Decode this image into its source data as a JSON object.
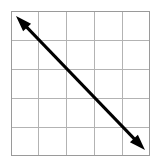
{
  "figure": {
    "title": "Diagonal double-headed arrow on a 5 by 5 grid",
    "background_color": "#ffffff",
    "width": 160,
    "height": 166
  },
  "grid": {
    "name": "graph-paper-grid",
    "columns": 5,
    "rows": 5,
    "left": 11,
    "top": 11,
    "right": 150,
    "bottom": 156,
    "cell_width": 27.8,
    "cell_height": 29,
    "line_color": "#b3b3b3",
    "border_color": "#9a9a9a",
    "line_width": 1,
    "x_positions": [
      11,
      38.8,
      66.6,
      94.4,
      122.2,
      150
    ],
    "y_positions": [
      11,
      40,
      69,
      98,
      127,
      156
    ]
  },
  "chart_data": {
    "type": "line",
    "title": "Diagonal double-headed arrow on a 5 by 5 grid",
    "xlabel": "",
    "ylabel": "",
    "xlim": [
      0,
      5
    ],
    "ylim": [
      0,
      5
    ],
    "grid": true,
    "legend": "none",
    "series": [
      {
        "name": "negative-slope-line",
        "style": "double-headed arrow",
        "color": "#000000",
        "line_width": 3,
        "x": [
          0.18,
          4.82
        ],
        "y": [
          4.82,
          0.21
        ],
        "slope": -1,
        "pixel_start": [
          16,
          16
        ],
        "pixel_end": [
          145,
          150
        ]
      }
    ],
    "annotations": [
      {
        "name": "arrowhead-upper-left",
        "at": [
          16,
          16
        ],
        "direction": "up-left"
      },
      {
        "name": "arrowhead-lower-right",
        "at": [
          145,
          150
        ],
        "direction": "down-right"
      }
    ]
  },
  "arrow": {
    "name": "double-headed-arrow",
    "color": "#000000",
    "stroke_width": 3,
    "start_x": 16,
    "start_y": 16,
    "end_x": 145,
    "end_y": 150,
    "head_length": 16,
    "head_half_width": 5.5
  }
}
